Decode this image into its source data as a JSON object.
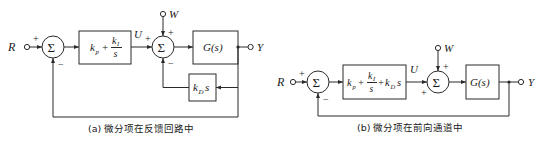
{
  "diagram_a": {
    "caption": "(a) 微分项在反馈回路中",
    "input_label": "R",
    "output_label": "Y",
    "disturbance_label": "W",
    "control_signal_label": "U",
    "sum1": {
      "symbol": "Σ",
      "sign_left": "+",
      "sign_bottom": "−"
    },
    "sum2": {
      "symbol": "Σ",
      "sign_left": "+",
      "sign_top": "+",
      "sign_bottom": "−"
    },
    "controller_block": {
      "kp": "k",
      "kp_sub": "p",
      "plus": "+",
      "ki": "k",
      "ki_sub": "I",
      "den": "s"
    },
    "plant_block": "G(s)",
    "derivative_block": {
      "k": "k",
      "sub": "D",
      "s": "s"
    }
  },
  "diagram_b": {
    "caption": "(b) 微分项在前向通道中",
    "input_label": "R",
    "output_label": "Y",
    "disturbance_label": "W",
    "control_signal_label": "U",
    "sum1": {
      "symbol": "Σ",
      "sign_left": "+",
      "sign_bottom": "−"
    },
    "sum2": {
      "symbol": "Σ",
      "sign_left": "+",
      "sign_top": "+"
    },
    "controller_block": {
      "kp": "k",
      "kp_sub": "p",
      "plus1": "+",
      "ki": "k",
      "ki_sub": "I",
      "den": "s",
      "plus2": "+",
      "kd": "k",
      "kd_sub": "D",
      "s": "s"
    },
    "plant_block": "G(s)"
  },
  "colors": {
    "line": "#2a2a2a",
    "text": "#1a1a1a",
    "background": "#ffffff"
  }
}
